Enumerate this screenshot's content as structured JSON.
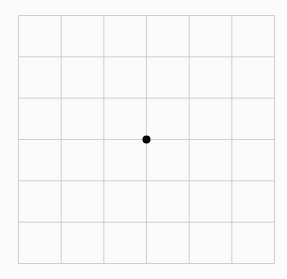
{
  "grid": {
    "columns": 6,
    "rows": 6,
    "line_color": "#cfcfcf",
    "background_color": "#fbfbfb"
  },
  "marker": {
    "column_index": 3,
    "row_index": 3,
    "color": "#000000",
    "shape": "dot"
  }
}
